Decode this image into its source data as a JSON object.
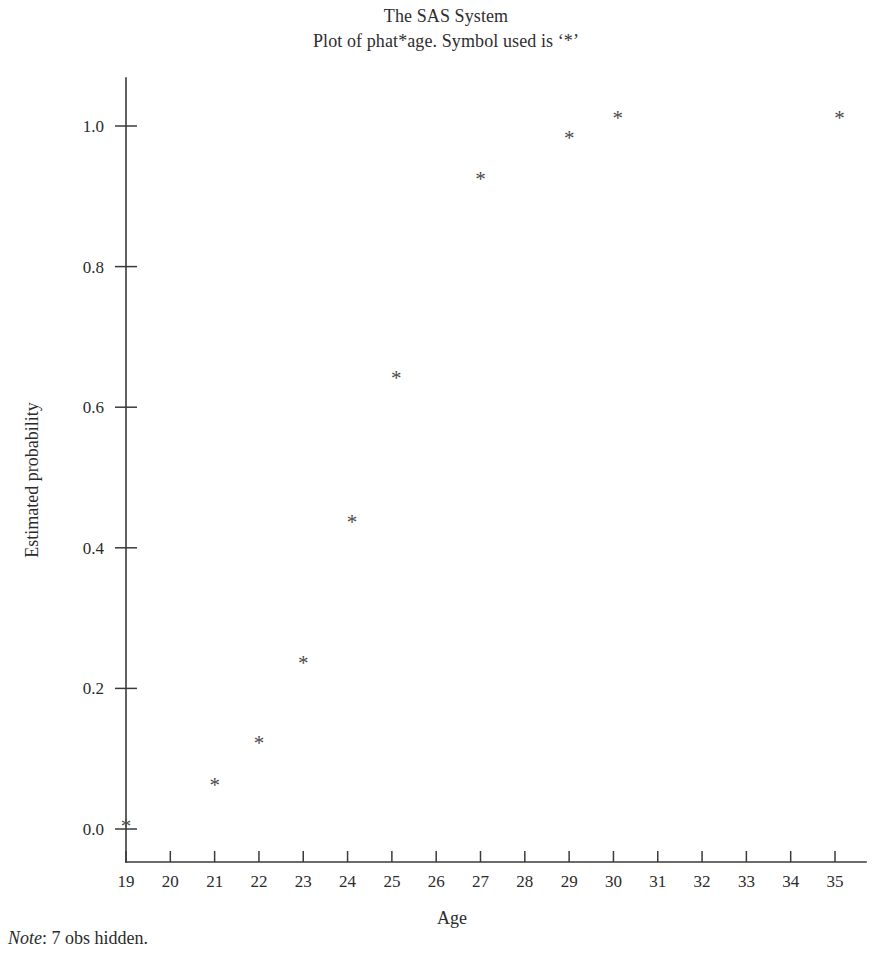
{
  "header": {
    "title_line_1": "The SAS System",
    "title_line_2": "Plot of phat*age. Symbol used is ‘*’"
  },
  "footnote": {
    "label": "Note",
    "separator": ":",
    "text": " 7 obs hidden."
  },
  "chart_data": {
    "type": "scatter",
    "title": "The SAS System",
    "subtitle": "Plot of phat*age. Symbol used is ‘*’",
    "xlabel": "Age",
    "ylabel": "Estimated probability",
    "symbol": "*",
    "marker_color": "#4a4a4a",
    "axis_color": "#3a3a3a",
    "grid": false,
    "legend": "none",
    "xlim": [
      19,
      35
    ],
    "ylim": [
      0.0,
      1.0
    ],
    "xticks": [
      19,
      20,
      21,
      22,
      23,
      24,
      25,
      26,
      27,
      28,
      29,
      30,
      31,
      32,
      33,
      34,
      35
    ],
    "xticklabels": [
      "19",
      "20",
      "21",
      "22",
      "23",
      "24",
      "25",
      "26",
      "27",
      "28",
      "29",
      "30",
      "31",
      "32",
      "33",
      "34",
      "35"
    ],
    "yticks": [
      0.0,
      0.2,
      0.4,
      0.6,
      0.8,
      1.0
    ],
    "yticklabels": [
      "0.0",
      "0.2",
      "0.4",
      "0.6",
      "0.8",
      "1.0"
    ],
    "points": [
      {
        "x": 19.0,
        "y": 0.004
      },
      {
        "x": 21.0,
        "y": 0.063
      },
      {
        "x": 22.0,
        "y": 0.122
      },
      {
        "x": 23.0,
        "y": 0.236
      },
      {
        "x": 24.1,
        "y": 0.437
      },
      {
        "x": 25.1,
        "y": 0.641
      },
      {
        "x": 27.0,
        "y": 0.925
      },
      {
        "x": 29.0,
        "y": 0.983
      },
      {
        "x": 30.1,
        "y": 1.012
      },
      {
        "x": 35.1,
        "y": 1.012
      }
    ]
  }
}
